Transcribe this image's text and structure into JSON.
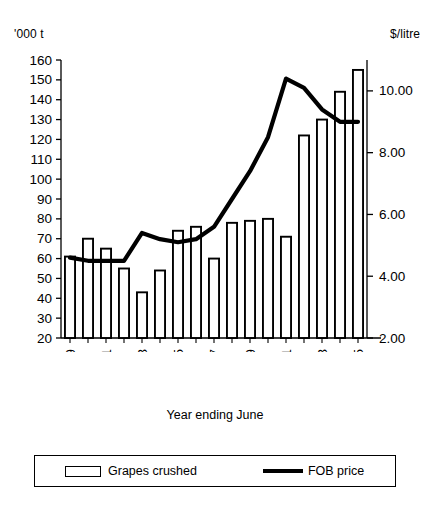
{
  "axis_units": {
    "left": "'000 t",
    "right": "$/litre"
  },
  "xaxis_title": "Year ending June",
  "legend": {
    "items": [
      {
        "label": "Grapes crushed",
        "marker": "bar-swatch",
        "color": "#ffffff"
      },
      {
        "label": "FOB price",
        "marker": "line-swatch",
        "color": "#000000"
      }
    ]
  },
  "chart_data": {
    "type": "bar",
    "title": "",
    "xlabel": "Year ending June",
    "ylabel": "'000 t",
    "y2label": "$/litre",
    "grid": false,
    "legend_position": "bottom",
    "categories": [
      "1989",
      "1990",
      "1991",
      "1992",
      "1993",
      "1994",
      "1995",
      "1996",
      "1997",
      "1998",
      "1999",
      "2000",
      "2001",
      "2002",
      "2003",
      "2004",
      "2005"
    ],
    "tick_labels_shown": [
      "1989",
      "1991",
      "1993",
      "1995",
      "1997",
      "1999",
      "2001",
      "2003",
      "2005"
    ],
    "ylim": [
      20,
      160
    ],
    "yticks": [
      20,
      30,
      40,
      50,
      60,
      70,
      80,
      90,
      100,
      110,
      120,
      130,
      140,
      150,
      160
    ],
    "ytick_labels": [
      "20",
      "30",
      "40",
      "50",
      "60",
      "70",
      "80",
      "90",
      "100",
      "110",
      "120",
      "130",
      "140",
      "150",
      "160"
    ],
    "y2lim": [
      2.0,
      11.0
    ],
    "y2ticks": [
      2.0,
      4.0,
      6.0,
      8.0,
      10.0
    ],
    "y2tick_labels": [
      "2.00",
      "4.00",
      "6.00",
      "8.00",
      "10.00"
    ],
    "series": [
      {
        "name": "Grapes crushed",
        "type": "bar",
        "axis": "left",
        "unit": "'000 t",
        "values": [
          61,
          70,
          65,
          55,
          43,
          54,
          74,
          76,
          60,
          78,
          79,
          80,
          71,
          122,
          130,
          144,
          155
        ]
      },
      {
        "name": "FOB price",
        "type": "line",
        "axis": "right",
        "unit": "$/litre",
        "values": [
          4.6,
          4.5,
          4.5,
          4.5,
          5.4,
          5.2,
          5.1,
          5.2,
          5.6,
          6.5,
          7.4,
          8.5,
          10.4,
          10.1,
          9.4,
          9.0,
          9.0
        ]
      }
    ]
  }
}
